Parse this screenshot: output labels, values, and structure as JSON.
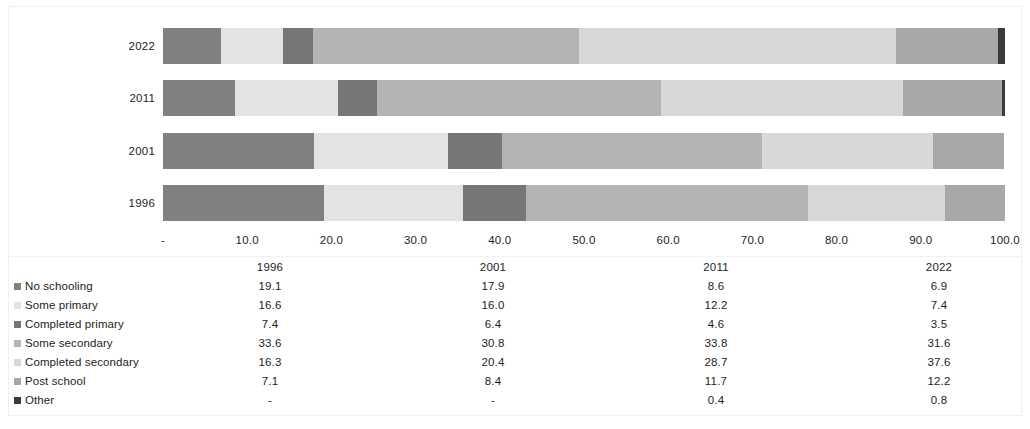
{
  "chart_data": {
    "type": "bar",
    "orientation": "horizontal",
    "stacked": true,
    "normalized_percent": true,
    "title": "",
    "subtitle": "",
    "xlabel": "",
    "ylabel": "",
    "xlim": [
      0,
      100
    ],
    "grid": false,
    "legend_position": "bottom-left",
    "categories": [
      "1996",
      "2001",
      "2011",
      "2022"
    ],
    "bar_order_top_to_bottom": [
      "2022",
      "2011",
      "2001",
      "1996"
    ],
    "x_tick_labels": [
      "-",
      "10.0",
      "20.0",
      "30.0",
      "40.0",
      "50.0",
      "60.0",
      "70.0",
      "80.0",
      "90.0",
      "100.0"
    ],
    "x_tick_values": [
      0,
      10,
      20,
      30,
      40,
      50,
      60,
      70,
      80,
      90,
      100
    ],
    "series": [
      {
        "name": "No schooling",
        "color": "#808080",
        "values": [
          19.1,
          17.9,
          8.6,
          6.9
        ],
        "display": [
          "19.1",
          "17.9",
          "8.6",
          "6.9"
        ]
      },
      {
        "name": "Some primary",
        "color": "#e3e3e3",
        "values": [
          16.6,
          16.0,
          12.2,
          7.4
        ],
        "display": [
          "16.6",
          "16.0",
          "12.2",
          "7.4"
        ]
      },
      {
        "name": "Completed primary",
        "color": "#767676",
        "values": [
          7.4,
          6.4,
          4.6,
          3.5
        ],
        "display": [
          "7.4",
          "6.4",
          "4.6",
          "3.5"
        ]
      },
      {
        "name": "Some secondary",
        "color": "#b4b4b4",
        "values": [
          33.6,
          30.8,
          33.8,
          31.6
        ],
        "display": [
          "33.6",
          "30.8",
          "33.8",
          "31.6"
        ]
      },
      {
        "name": "Completed secondary",
        "color": "#d8d8d8",
        "values": [
          16.3,
          20.4,
          28.7,
          37.6
        ],
        "display": [
          "16.3",
          "20.4",
          "28.7",
          "37.6"
        ]
      },
      {
        "name": "Post school",
        "color": "#a8a8a8",
        "values": [
          7.1,
          8.4,
          11.7,
          12.2
        ],
        "display": [
          "7.1",
          "8.4",
          "11.7",
          "12.2"
        ]
      },
      {
        "name": "Other",
        "color": "#3a3a3a",
        "values": [
          0,
          0,
          0.4,
          0.8
        ],
        "display": [
          "-",
          "-",
          "0.4",
          "0.8"
        ]
      }
    ]
  },
  "table": {
    "header": {
      "blank": "",
      "years": [
        "1996",
        "2001",
        "2011",
        "2022"
      ]
    },
    "rows": [
      {
        "label": "No schooling",
        "swatch": "#808080",
        "values": [
          "19.1",
          "17.9",
          "8.6",
          "6.9"
        ]
      },
      {
        "label": "Some primary",
        "swatch": "#e3e3e3",
        "values": [
          "16.6",
          "16.0",
          "12.2",
          "7.4"
        ]
      },
      {
        "label": "Completed primary",
        "swatch": "#767676",
        "values": [
          "7.4",
          "6.4",
          "4.6",
          "3.5"
        ]
      },
      {
        "label": "Some secondary",
        "swatch": "#b4b4b4",
        "values": [
          "33.6",
          "30.8",
          "33.8",
          "31.6"
        ]
      },
      {
        "label": "Completed secondary",
        "swatch": "#d8d8d8",
        "values": [
          "16.3",
          "20.4",
          "28.7",
          "37.6"
        ]
      },
      {
        "label": "Post school",
        "swatch": "#a8a8a8",
        "values": [
          "7.1",
          "8.4",
          "11.7",
          "12.2"
        ]
      },
      {
        "label": "Other",
        "swatch": "#3a3a3a",
        "values": [
          "-",
          "-",
          "0.4",
          "0.8"
        ]
      }
    ]
  }
}
